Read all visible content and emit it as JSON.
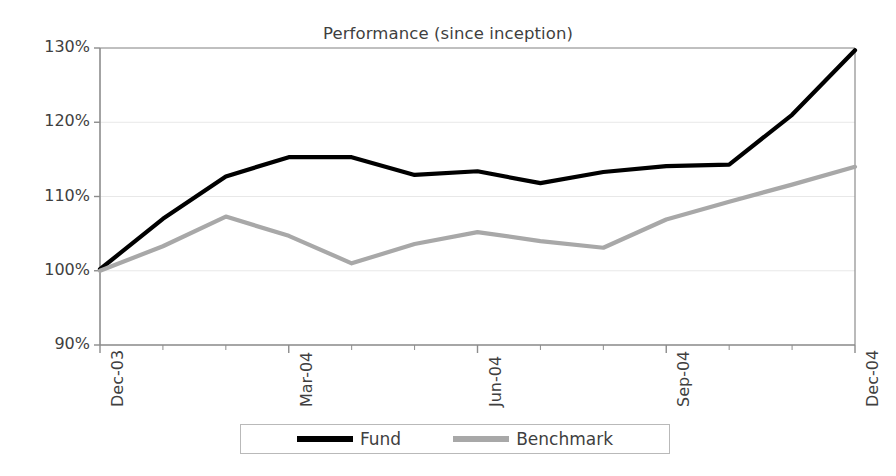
{
  "chart_data": {
    "type": "line",
    "title": "Performance (since inception)",
    "xlabel": "",
    "ylabel": "",
    "ylim": [
      90,
      130
    ],
    "ytick_values": [
      90,
      100,
      110,
      120,
      130
    ],
    "ytick_labels": [
      "90%",
      "100%",
      "110%",
      "120%",
      "130%"
    ],
    "grid": true,
    "legend_position": "bottom",
    "x": [
      "Dec-03",
      "Jan-04",
      "Feb-04",
      "Mar-04",
      "Apr-04",
      "May-04",
      "Jun-04",
      "Jul-04",
      "Aug-04",
      "Sep-04",
      "Oct-04",
      "Nov-04",
      "Dec-04"
    ],
    "xtick_labels": [
      "Dec-03",
      "Mar-04",
      "Jun-04",
      "Sep-04",
      "Dec-04"
    ],
    "xtick_indices": [
      0,
      3,
      6,
      9,
      12
    ],
    "series": [
      {
        "name": "Fund",
        "color": "#000000",
        "values": [
          100.2,
          107.0,
          112.7,
          115.3,
          115.3,
          112.9,
          113.4,
          111.8,
          113.3,
          114.1,
          114.3,
          121.0,
          129.7
        ]
      },
      {
        "name": "Benchmark",
        "color": "#a8a8a8",
        "values": [
          100.0,
          103.3,
          107.3,
          104.7,
          101.0,
          103.6,
          105.2,
          104.0,
          103.1,
          106.9,
          109.3,
          111.6,
          114.0
        ]
      }
    ]
  },
  "legend": {
    "items": [
      {
        "label": "Fund",
        "color": "#000000"
      },
      {
        "label": "Benchmark",
        "color": "#a8a8a8"
      }
    ]
  },
  "colors": {
    "fund": "#000000",
    "benchmark": "#a8a8a8",
    "axis": "#8c8c8c",
    "grid": "#e8e8e8",
    "text": "#3f3f3f",
    "background": "#ffffff"
  }
}
